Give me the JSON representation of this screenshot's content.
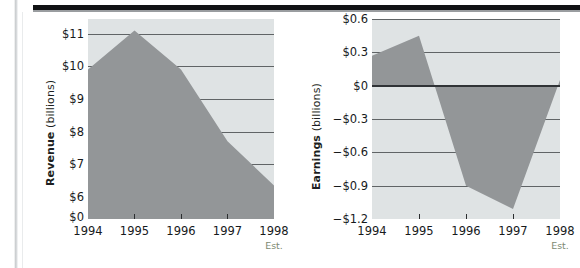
{
  "page": {
    "background_color": "#ffffff",
    "rule_color": "#111214",
    "area_fill_color": "#939698",
    "plot_background_color": "#dfe3e4",
    "gridline_color": "#4a4d50",
    "est_label_color": "#7d8a72"
  },
  "charts": [
    {
      "id": "revenue",
      "type": "area",
      "title": "",
      "ylabel_bold": "Revenue",
      "ylabel_unit": " (billions)",
      "xlabel": "",
      "categories": [
        "1994",
        "1995",
        "1996",
        "1997",
        "1998"
      ],
      "x_note": "Est.",
      "x_note_on": "1998",
      "values": [
        9.9,
        11.1,
        9.9,
        7.7,
        6.35
      ],
      "value_labels": [
        "$9.9",
        "$11.1",
        "$9.9",
        "$7.7",
        "$6.35"
      ],
      "ytick_labels": [
        "$11",
        "$10",
        "$9",
        "$8",
        "$7",
        "$6",
        "$0"
      ],
      "ytick_values": [
        11,
        10,
        9,
        8,
        7,
        6,
        0
      ],
      "ylim": [
        5.6,
        11.45
      ],
      "axis_broken": true,
      "grid": true,
      "legend": "none"
    },
    {
      "id": "earnings",
      "type": "area",
      "title": "",
      "ylabel_bold": "Earnings",
      "ylabel_unit": " (billions)",
      "xlabel": "",
      "categories": [
        "1994",
        "1995",
        "1996",
        "1997",
        "1998"
      ],
      "x_note": "Est.",
      "x_note_on": "1998",
      "values": [
        0.27,
        0.45,
        -0.9,
        -1.11,
        0.05
      ],
      "value_labels": [
        "$0.27",
        "$0.45",
        "-$0.9",
        "-$1.11",
        "$0.05"
      ],
      "ytick_labels": [
        "$0.6",
        "$0.3",
        "$0",
        "−$0.3",
        "−$0.6",
        "−$0.9",
        "−$1.2"
      ],
      "ytick_values": [
        0.6,
        0.3,
        0,
        -0.3,
        -0.6,
        -0.9,
        -1.2
      ],
      "ylim": [
        -1.2,
        0.6
      ],
      "zero_line": 0,
      "grid": true,
      "legend": "none"
    }
  ],
  "chart_data": [
    {
      "type": "area",
      "title": "Revenue (billions)",
      "xlabel": "",
      "ylabel": "Revenue (billions)",
      "categories": [
        "1994",
        "1995",
        "1996",
        "1997",
        "1998"
      ],
      "values": [
        9.9,
        11.1,
        9.9,
        7.7,
        6.35
      ],
      "ytick_labels": [
        "$11",
        "$10",
        "$9",
        "$8",
        "$7",
        "$6",
        "$0"
      ],
      "ylim": [
        5.6,
        11.45
      ],
      "grid": true,
      "legend": "none",
      "annotations": [
        "Est. under 1998"
      ]
    },
    {
      "type": "area",
      "title": "Earnings (billions)",
      "xlabel": "",
      "ylabel": "Earnings (billions)",
      "categories": [
        "1994",
        "1995",
        "1996",
        "1997",
        "1998"
      ],
      "values": [
        0.27,
        0.45,
        -0.9,
        -1.11,
        0.05
      ],
      "ytick_labels": [
        "$0.6",
        "$0.3",
        "$0",
        "−$0.3",
        "−$0.6",
        "−$0.9",
        "−$1.2"
      ],
      "ylim": [
        -1.2,
        0.6
      ],
      "grid": true,
      "legend": "none",
      "annotations": [
        "Est. under 1998"
      ]
    }
  ]
}
